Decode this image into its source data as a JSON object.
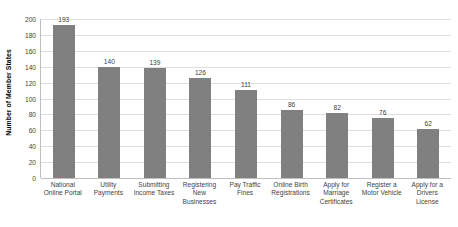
{
  "chart_data": {
    "type": "bar",
    "title": "",
    "xlabel": "",
    "ylabel": "Number of Member States",
    "ylim": [
      0,
      200
    ],
    "yticks": [
      200,
      180,
      160,
      140,
      120,
      100,
      80,
      60,
      40,
      20,
      0
    ],
    "grid": true,
    "legend": false,
    "bar_color": "#808080",
    "gridline_color": "#dedede",
    "axis_color": "#bfbfbf",
    "background_color": "#ffffff",
    "categories": [
      "National Online Portal",
      "Utility Payments",
      "Submitting Income Taxes",
      "Registering New Businesses",
      "Pay Traffic Fines",
      "Online Birth Registrations",
      "Apply for Marriage Certificates",
      "Register a Motor Vehicle",
      "Apply for a Drivers License"
    ],
    "category_label_lines": [
      [
        "National",
        "Online Portal"
      ],
      [
        "Utility",
        "Payments"
      ],
      [
        "Submitting",
        "Income Taxes"
      ],
      [
        "Registering",
        "New",
        "Businesses"
      ],
      [
        "Pay Traffic",
        "Fines"
      ],
      [
        "Online Birth",
        "Registrations"
      ],
      [
        "Apply for",
        "Marriage",
        "Certificates"
      ],
      [
        "Register a",
        "Motor Vehicle"
      ],
      [
        "Apply for a",
        "Drivers",
        "License"
      ]
    ],
    "values": [
      193,
      140,
      139,
      126,
      111,
      86,
      82,
      76,
      62
    ]
  }
}
